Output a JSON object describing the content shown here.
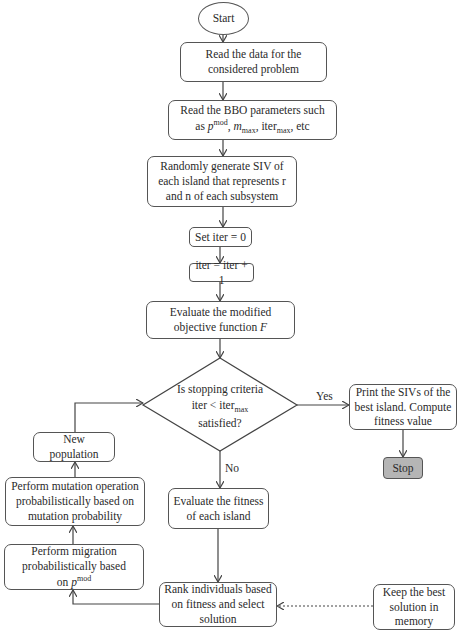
{
  "diagram": {
    "type": "flowchart",
    "nodes": {
      "start": {
        "label": "Start"
      },
      "read_data": {
        "label": "Read the data for the considered problem"
      },
      "read_bbo": {
        "line1": "Read the BBO parameters such",
        "line2_prefix": "as ",
        "p": "p",
        "p_sup": "mod",
        "m": "m",
        "m_sub": "max",
        "iter": "iter",
        "iter_sub": "max",
        "suffix": "etc"
      },
      "random_gen": {
        "label": "Randomly generate SIV of each island that represents r and n of each subsystem"
      },
      "set_iter": {
        "label": "Set iter = 0"
      },
      "iter_inc": {
        "label": "iter = iter + 1"
      },
      "eval_obj": {
        "label_main": "Evaluate the modified objective function ",
        "label_var": "F"
      },
      "decision": {
        "line1": "Is stopping criteria",
        "line2": "iter < ",
        "line2_iter": "iter",
        "line2_sub": "max",
        "line3": "satisfied?"
      },
      "print": {
        "label": "Print the SIVs of the best island. Compute fitness value"
      },
      "stop": {
        "label": "Stop"
      },
      "eval_fitness": {
        "label": "Evaluate the fitness of each island"
      },
      "rank": {
        "label": "Rank individuals based on fitness and select solution"
      },
      "keep_best": {
        "label": "Keep the best solution in memory"
      },
      "migration": {
        "label_main": "Perform migration probabilistically based on ",
        "p": "p",
        "p_sup": "mod"
      },
      "mutation": {
        "label": "Perform mutation operation probabilistically based on mutation probability"
      },
      "new_population": {
        "label": "New population"
      }
    },
    "edge_labels": {
      "yes": "Yes",
      "no": "No"
    },
    "colors": {
      "stroke": "#555555",
      "stop_fill": "#b5b5b5",
      "background": "#ffffff"
    }
  }
}
